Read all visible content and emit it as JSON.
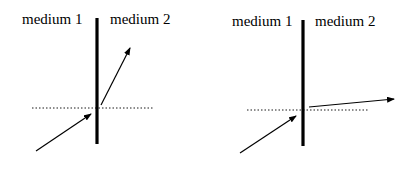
{
  "diagrams": [
    {
      "medium1_label": "medium 1",
      "medium2_label": "medium 2",
      "description": "refraction toward normal-ish, steep refracted ray"
    },
    {
      "medium1_label": "medium 1",
      "medium2_label": "medium 2",
      "description": "refraction bending away, nearly grazing refracted ray"
    }
  ],
  "colors": {
    "line": "#000000",
    "background": "#ffffff"
  }
}
